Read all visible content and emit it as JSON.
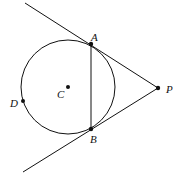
{
  "diagram": {
    "type": "geometry",
    "circle": {
      "center_label": "C",
      "cx": 68,
      "cy": 87,
      "r": 47
    },
    "points": {
      "A": {
        "label": "A",
        "x": 91,
        "y": 44
      },
      "B": {
        "label": "B",
        "x": 91,
        "y": 129
      },
      "C": {
        "label": "C",
        "x": 68,
        "y": 87
      },
      "D": {
        "label": "D",
        "x": 23,
        "y": 101
      },
      "P": {
        "label": "P",
        "x": 158,
        "y": 88
      }
    },
    "segments": [
      {
        "from": "tangent-top-end",
        "to": "P"
      },
      {
        "from": "tangent-bottom-end",
        "to": "P"
      },
      {
        "from": "A",
        "to": "B"
      }
    ],
    "colors": {
      "stroke": "#111111",
      "background": "#ffffff"
    }
  }
}
